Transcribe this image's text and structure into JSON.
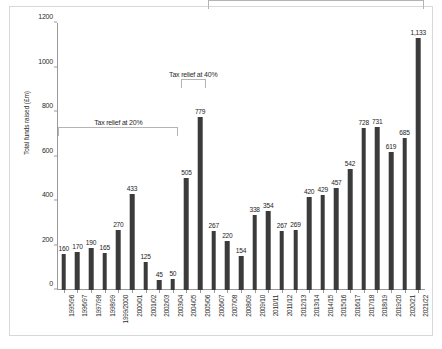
{
  "chart_data": {
    "type": "bar",
    "title": "",
    "xlabel": "",
    "ylabel": "Total funds raised (£m)",
    "ylim": [
      0,
      1200
    ],
    "yticks": [
      0,
      200,
      400,
      600,
      800,
      1000,
      1200
    ],
    "ytick_labels": [
      "0",
      "200",
      "400",
      "600",
      "800",
      "1000",
      "1200"
    ],
    "grid": false,
    "legend": false,
    "bar_color": "#3b3b3b",
    "categories": [
      "1995/96",
      "1996/97",
      "1997/98",
      "1998/99",
      "1999/2000",
      "2000/01",
      "2001/02",
      "2002/03",
      "2003/04",
      "2004/05",
      "2005/06",
      "2006/07",
      "2007/08",
      "2008/09",
      "2009/10",
      "2010/11",
      "2011/12",
      "2012/13",
      "2013/14",
      "2014/15",
      "2015/16",
      "2016/17",
      "2017/18",
      "2018/19",
      "2019/20",
      "2020/21",
      "2021/22"
    ],
    "values": [
      160,
      170,
      190,
      165,
      270,
      433,
      125,
      45,
      50,
      505,
      779,
      267,
      220,
      154,
      338,
      354,
      267,
      269,
      420,
      429,
      457,
      542,
      728,
      731,
      619,
      685,
      1133
    ],
    "value_labels": [
      "160",
      "170",
      "190",
      "165",
      "270",
      "433",
      "125",
      "45",
      "50",
      "505",
      "779",
      "267",
      "220",
      "154",
      "338",
      "354",
      "267",
      "269",
      "420",
      "429",
      "457",
      "542",
      "728",
      "731",
      "619",
      "685",
      "1,133"
    ],
    "annotations": [
      {
        "id": "relief-20",
        "label": "Tax relief at 20%",
        "start_category": "1995/96",
        "end_category": "2003/04",
        "bracket_top_value": 690
      },
      {
        "id": "relief-40",
        "label": "Tax relief at 40%",
        "start_category": "2004/05",
        "end_category": "2005/06",
        "bracket_top_value": 910
      },
      {
        "id": "relief-30",
        "label": "Tax relief at 30%",
        "start_category": "2006/07",
        "end_category": "2021/22",
        "bracket_top_value": 1265
      }
    ]
  }
}
